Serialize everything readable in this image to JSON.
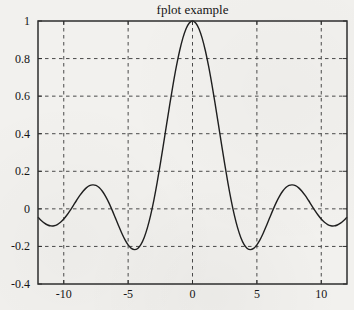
{
  "figure": {
    "title": "fplot example"
  },
  "chart_data": {
    "type": "line",
    "title": "fplot example",
    "xlabel": "",
    "ylabel": "",
    "xlim": [
      -12,
      12
    ],
    "ylim": [
      -0.4,
      1
    ],
    "xticks": [
      -10,
      -5,
      0,
      5,
      10
    ],
    "xtick_labels": [
      "-10",
      "-5",
      "0",
      "5",
      "10"
    ],
    "yticks": [
      -0.4,
      -0.2,
      0,
      0.2,
      0.4,
      0.6,
      0.8,
      1
    ],
    "ytick_labels": [
      "-0.4",
      "-0.2",
      "0",
      "0.2",
      "0.4",
      "0.6",
      "0.8",
      "1"
    ],
    "grid": "dashed",
    "legend": "none",
    "series": [
      {
        "name": "sin(x)/x",
        "x_start": -12,
        "x_step": 0.25,
        "y": [
          -0.0447,
          -0.062,
          -0.0761,
          -0.086,
          -0.0909,
          -0.0902,
          -0.0838,
          -0.0716,
          -0.0544,
          -0.0328,
          -0.0079,
          0.0188,
          0.0458,
          0.0714,
          0.094,
          0.1118,
          0.1237,
          0.1277,
          0.1251,
          0.1137,
          0.0939,
          0.0667,
          0.0331,
          -0.0054,
          -0.0466,
          -0.0884,
          -0.1283,
          -0.1636,
          -0.1918,
          -0.2104,
          -0.2172,
          -0.2106,
          -0.1892,
          -0.1524,
          -0.1002,
          -0.0333,
          0.047,
          0.1388,
          0.2394,
          0.3458,
          0.4546,
          0.5623,
          0.665,
          0.7592,
          0.8415,
          0.9089,
          0.9589,
          0.9896,
          1.0,
          0.9896,
          0.9589,
          0.9089,
          0.8415,
          0.7592,
          0.665,
          0.5623,
          0.4546,
          0.3458,
          0.2394,
          0.1388,
          0.047,
          -0.0333,
          -0.1002,
          -0.1524,
          -0.1892,
          -0.2106,
          -0.2172,
          -0.2104,
          -0.1918,
          -0.1636,
          -0.1283,
          -0.0884,
          -0.0466,
          -0.0054,
          0.0331,
          0.0667,
          0.0939,
          0.1137,
          0.1251,
          0.1277,
          0.1237,
          0.1118,
          0.094,
          0.0714,
          0.0458,
          0.0188,
          -0.0079,
          -0.0328,
          -0.0544,
          -0.0716,
          -0.0838,
          -0.0902,
          -0.0909,
          -0.086,
          -0.0761,
          -0.062,
          -0.0447
        ]
      }
    ],
    "colors": {
      "background": "#f2f1ee",
      "axis": "#2e2e2e",
      "grid": "#4a4a4a",
      "line": "#1f1f1f",
      "text": "#151515"
    }
  }
}
